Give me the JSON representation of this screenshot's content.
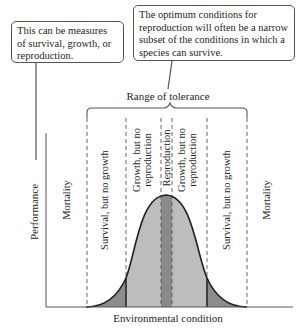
{
  "callouts": {
    "left": "This can be measures of survival, growth, or reproduction.",
    "right": "The optimum conditions for reproduction will often be a narrow subset of the conditions in which a species can survive."
  },
  "range_label": "Range of tolerance",
  "axes": {
    "ylabel": "Performance",
    "xlabel": "Environmental condition"
  },
  "zones": {
    "mortality_left": "Mortality",
    "survival_left": "Survival, but no growth",
    "growth_left_1": "Growth, but no",
    "growth_left_2": "reproduction",
    "reproduction": "Reproduction",
    "growth_right_1": "Growth, but no",
    "growth_right_2": "reproduction",
    "survival_right": "Survival, but no growth",
    "mortality_right": "Mortality"
  },
  "colors": {
    "survival_fill": "#8c8c8c",
    "growth_fill": "#bdbdbd",
    "reproduction_fill": "#8a8a8a",
    "line": "#231f20"
  }
}
